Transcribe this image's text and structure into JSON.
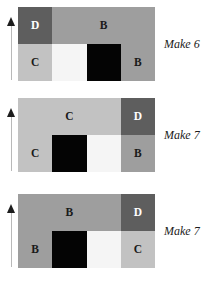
{
  "figure": {
    "background": "#ffffff",
    "block_count": 3,
    "palette": {
      "D": "#5e5e5e",
      "B": "#9e9e9e",
      "C": "#c2c2c2",
      "black": "#040404",
      "white": "#f5f5f5",
      "arrow": "#1d1d1d",
      "shaft": "#b9b9b9",
      "label_dark": "#1a1a1a",
      "label_light": "#ffffff"
    },
    "arrow_icon": "up-arrow-icon",
    "blocks": [
      {
        "id": "block-1",
        "caption": "Make 6",
        "arrow": "up-arrow-icon",
        "rows": [
          {
            "id": "block-1-top-row",
            "cells": [
              {
                "label": "D",
                "fill": "#5e5e5e",
                "text_color": "#ffffff",
                "width_pct": 25
              },
              {
                "label": "B",
                "fill": "#9e9e9e",
                "text_color": "#1a1a1a",
                "width_pct": 75
              }
            ]
          },
          {
            "id": "block-1-bottom-row",
            "cells": [
              {
                "label": "C",
                "fill": "#c2c2c2",
                "text_color": "#1a1a1a",
                "width_pct": 25
              },
              {
                "label": "",
                "fill": "#f5f5f5",
                "text_color": "#1a1a1a",
                "width_pct": 25
              },
              {
                "label": "",
                "fill": "#040404",
                "text_color": "#ffffff",
                "width_pct": 25
              },
              {
                "label": "B",
                "fill": "#9e9e9e",
                "text_color": "#1a1a1a",
                "width_pct": 25
              }
            ]
          }
        ]
      },
      {
        "id": "block-2",
        "caption": "Make 7",
        "arrow": "up-arrow-icon",
        "rows": [
          {
            "id": "block-2-top-row",
            "cells": [
              {
                "label": "C",
                "fill": "#c2c2c2",
                "text_color": "#1a1a1a",
                "width_pct": 75
              },
              {
                "label": "D",
                "fill": "#5e5e5e",
                "text_color": "#ffffff",
                "width_pct": 25
              }
            ]
          },
          {
            "id": "block-2-bottom-row",
            "cells": [
              {
                "label": "C",
                "fill": "#c2c2c2",
                "text_color": "#1a1a1a",
                "width_pct": 25
              },
              {
                "label": "",
                "fill": "#040404",
                "text_color": "#ffffff",
                "width_pct": 25
              },
              {
                "label": "",
                "fill": "#f5f5f5",
                "text_color": "#1a1a1a",
                "width_pct": 25
              },
              {
                "label": "B",
                "fill": "#9e9e9e",
                "text_color": "#1a1a1a",
                "width_pct": 25
              }
            ]
          }
        ]
      },
      {
        "id": "block-3",
        "caption": "Make 7",
        "arrow": "up-arrow-icon",
        "rows": [
          {
            "id": "block-3-top-row",
            "cells": [
              {
                "label": "B",
                "fill": "#9e9e9e",
                "text_color": "#1a1a1a",
                "width_pct": 75
              },
              {
                "label": "D",
                "fill": "#5e5e5e",
                "text_color": "#ffffff",
                "width_pct": 25
              }
            ]
          },
          {
            "id": "block-3-bottom-row",
            "cells": [
              {
                "label": "B",
                "fill": "#9e9e9e",
                "text_color": "#1a1a1a",
                "width_pct": 25
              },
              {
                "label": "",
                "fill": "#040404",
                "text_color": "#ffffff",
                "width_pct": 25
              },
              {
                "label": "",
                "fill": "#f5f5f5",
                "text_color": "#1a1a1a",
                "width_pct": 25
              },
              {
                "label": "C",
                "fill": "#c2c2c2",
                "text_color": "#1a1a1a",
                "width_pct": 25
              }
            ]
          }
        ]
      }
    ]
  }
}
